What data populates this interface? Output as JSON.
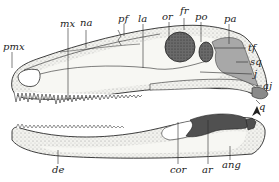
{
  "figure": {
    "type": "anatomical skull diagram, lateral view",
    "colors": {
      "line": "#2a2a2a",
      "bone_light": "#f4f4f0",
      "stipple": "#9a9a9a",
      "orbit": "#5c5c5c",
      "squamosal_shade": "#a8a8a8",
      "mandible_dark": "#505050"
    }
  },
  "labels": {
    "pmx": "pmx",
    "mx": "mx",
    "na": "na",
    "pf": "pf",
    "la": "la",
    "or": "or",
    "fr": "fr",
    "po": "po",
    "pa": "pa",
    "tf": "tf",
    "sq": "sq",
    "j": "j",
    "aj": "aj",
    "q": "q",
    "de": "de",
    "cor": "cor",
    "ar": "ar",
    "ang": "ang"
  }
}
